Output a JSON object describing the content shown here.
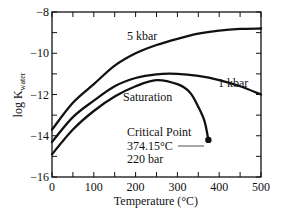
{
  "chart_data": {
    "type": "line",
    "title": "",
    "xlabel": "Temperature (°C)",
    "ylabel": "log K_water",
    "ylabel_main": "log K",
    "ylabel_sub": "water",
    "xlim": [
      0,
      500
    ],
    "ylim": [
      -16,
      -8
    ],
    "xticks": [
      0,
      100,
      200,
      300,
      400,
      500
    ],
    "yticks": [
      -16,
      -14,
      -12,
      -10,
      -8
    ],
    "minor_xtick_step": 50,
    "minor_ytick_step": 1,
    "grid": false,
    "series": [
      {
        "name": "5 kbar",
        "x": [
          0,
          50,
          100,
          150,
          200,
          250,
          300,
          350,
          400,
          450,
          500
        ],
        "values": [
          -13.7,
          -12.4,
          -11.5,
          -10.6,
          -10.0,
          -9.6,
          -9.3,
          -9.05,
          -8.9,
          -8.82,
          -8.8
        ]
      },
      {
        "name": "1 kbar",
        "x": [
          0,
          50,
          100,
          150,
          200,
          250,
          300,
          350,
          400,
          450,
          500
        ],
        "values": [
          -14.3,
          -13.1,
          -12.3,
          -11.6,
          -11.2,
          -11.02,
          -11.0,
          -11.1,
          -11.3,
          -11.6,
          -12.0
        ]
      },
      {
        "name": "Saturation",
        "x": [
          0,
          50,
          100,
          150,
          200,
          250,
          300,
          330,
          350,
          365,
          374.15
        ],
        "values": [
          -14.9,
          -13.7,
          -12.8,
          -12.1,
          -11.6,
          -11.3,
          -11.5,
          -11.9,
          -12.6,
          -13.3,
          -14.2
        ]
      }
    ],
    "annotations": [
      {
        "text": "Critical Point",
        "x": 374.15,
        "y": -14.2
      },
      {
        "text": "374.15°C"
      },
      {
        "text": "220 bar"
      }
    ],
    "legend": "inline labels on curves"
  }
}
